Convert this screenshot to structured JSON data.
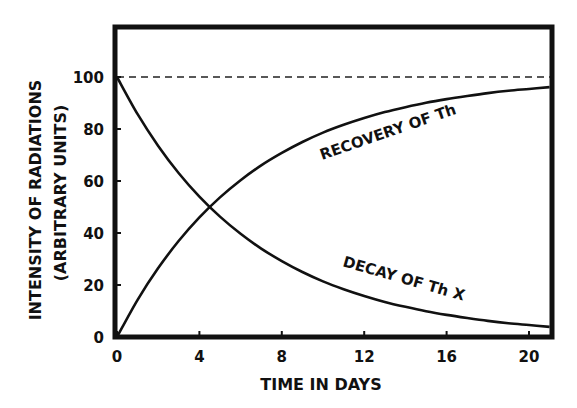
{
  "chart_data": {
    "type": "line",
    "title": "",
    "xlabel": "TIME IN DAYS",
    "ylabel": "INTENSITY OF RADIATIONS",
    "ylabel_sub": "(ARBITRARY UNITS)",
    "xlim": [
      0,
      21
    ],
    "ylim": [
      0,
      118
    ],
    "x_ticks": [
      0,
      4,
      8,
      12,
      16,
      20
    ],
    "x_tick_labels": [
      "0",
      "4",
      "8",
      "12",
      "16",
      "20"
    ],
    "y_ticks": [
      0,
      20,
      40,
      60,
      80,
      100
    ],
    "y_tick_labels": [
      "0",
      "20",
      "40",
      "60",
      "80",
      "100"
    ],
    "grid": false,
    "reference_line": {
      "y": 100,
      "style": "dashed"
    },
    "x": [
      0,
      1,
      2,
      3,
      4,
      5,
      6,
      7,
      8,
      9,
      10,
      11,
      12,
      13,
      14,
      15,
      16,
      17,
      18,
      19,
      20,
      21
    ],
    "series": [
      {
        "name": "RECOVERY OF Th",
        "values": [
          0,
          14.3,
          26.5,
          37.0,
          46.0,
          53.7,
          60.3,
          66.0,
          70.8,
          75.0,
          78.6,
          81.6,
          84.2,
          86.5,
          88.4,
          90.1,
          91.5,
          92.7,
          93.8,
          94.7,
          95.4,
          96.1
        ]
      },
      {
        "name": "DECAY OF Th X",
        "values": [
          100,
          85.7,
          73.5,
          63.0,
          54.0,
          46.3,
          39.7,
          34.0,
          29.2,
          25.0,
          21.4,
          18.4,
          15.8,
          13.5,
          11.6,
          9.9,
          8.5,
          7.3,
          6.2,
          5.3,
          4.6,
          3.9
        ]
      }
    ],
    "annotations": [
      {
        "text": "RECOVERY OF Th",
        "x": 13.5,
        "y": 72
      },
      {
        "text": "DECAY OF Th X",
        "x": 15,
        "y": 22
      }
    ]
  }
}
